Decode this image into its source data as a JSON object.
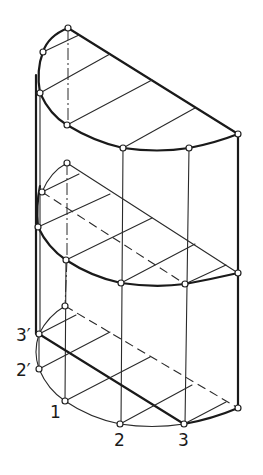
{
  "figure": {
    "labels": {
      "p1": "1",
      "p2": "2",
      "p3": "3",
      "p2prime": "2′",
      "p3prime": "3′"
    },
    "colors": {
      "line": "#1a1a1a",
      "background": "#ffffff"
    },
    "caption_visible": false
  }
}
